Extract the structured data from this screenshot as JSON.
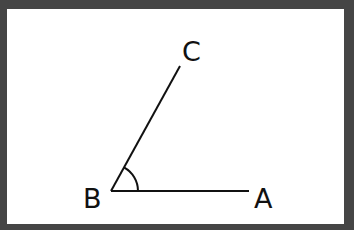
{
  "diagram": {
    "type": "angle",
    "vertex": {
      "label": "B",
      "x": 111,
      "y": 191
    },
    "ray_a": {
      "label": "A",
      "end_x": 249,
      "end_y": 191
    },
    "ray_c": {
      "label": "C",
      "end_x": 180,
      "end_y": 66
    },
    "arc_radius": 27,
    "colors": {
      "frame": "#454545",
      "background": "#ffffff",
      "stroke": "#111111"
    }
  },
  "labels": {
    "a": "A",
    "b": "B",
    "c": "C"
  }
}
